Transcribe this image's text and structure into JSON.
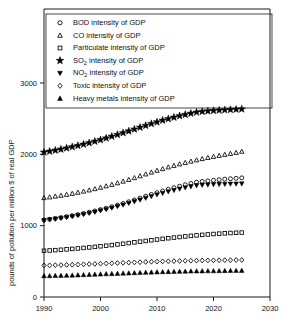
{
  "chart_data": {
    "type": "scatter",
    "title": "",
    "xlabel": "",
    "ylabel": "pounds of pollution per million $ of real GDP",
    "xlim": [
      1990,
      2030
    ],
    "ylim": [
      0,
      3300
    ],
    "xticks": [
      1990,
      2000,
      2010,
      2020,
      2030
    ],
    "yticks": [
      0,
      1000,
      2000,
      3000
    ],
    "grid": false,
    "legend_position": "upper-left",
    "x": [
      1990,
      1991,
      1992,
      1993,
      1994,
      1995,
      1996,
      1997,
      1998,
      1999,
      2000,
      2001,
      2002,
      2003,
      2004,
      2005,
      2006,
      2007,
      2008,
      2009,
      2010,
      2011,
      2012,
      2013,
      2014,
      2015,
      2016,
      2017,
      2018,
      2019,
      2020,
      2021,
      2022,
      2023,
      2024,
      2025
    ],
    "series": [
      {
        "name": "BOD intensity of GDP",
        "marker": "circle",
        "values": [
          1080,
          1090,
          1101,
          1113,
          1126,
          1140,
          1155,
          1171,
          1188,
          1206,
          1225,
          1245,
          1266,
          1288,
          1311,
          1335,
          1360,
          1386,
          1412,
          1438,
          1463,
          1487,
          1510,
          1532,
          1553,
          1573,
          1592,
          1610,
          1620,
          1628,
          1636,
          1644,
          1652,
          1658,
          1664,
          1670
        ]
      },
      {
        "name": "CO intensity of GDP",
        "marker": "triangle-up",
        "values": [
          1390,
          1400,
          1411,
          1423,
          1436,
          1450,
          1465,
          1481,
          1498,
          1516,
          1535,
          1555,
          1576,
          1598,
          1621,
          1645,
          1670,
          1696,
          1722,
          1748,
          1773,
          1797,
          1820,
          1842,
          1863,
          1883,
          1902,
          1920,
          1937,
          1953,
          1968,
          1982,
          1996,
          2010,
          2024,
          2040
        ]
      },
      {
        "name": "Particulate intensity of GDP",
        "marker": "square",
        "values": [
          648,
          652,
          657,
          662,
          668,
          674,
          681,
          688,
          695,
          703,
          711,
          719,
          728,
          737,
          746,
          756,
          766,
          776,
          786,
          796,
          806,
          815,
          824,
          833,
          841,
          849,
          857,
          864,
          871,
          877,
          883,
          888,
          893,
          897,
          900,
          903
        ]
      },
      {
        "name": "SO2 intensity of GDP",
        "marker": "star",
        "values": [
          2030,
          2042,
          2056,
          2071,
          2087,
          2104,
          2122,
          2141,
          2161,
          2182,
          2204,
          2227,
          2251,
          2276,
          2301,
          2326,
          2352,
          2378,
          2404,
          2429,
          2453,
          2476,
          2498,
          2519,
          2539,
          2557,
          2574,
          2590,
          2600,
          2607,
          2613,
          2618,
          2622,
          2626,
          2630,
          2634
        ]
      },
      {
        "name": "NO2 intensity of GDP",
        "marker": "triangle-down",
        "values": [
          1075,
          1084,
          1094,
          1105,
          1117,
          1130,
          1144,
          1159,
          1175,
          1192,
          1210,
          1229,
          1249,
          1270,
          1292,
          1315,
          1339,
          1363,
          1387,
          1411,
          1434,
          1456,
          1477,
          1497,
          1516,
          1533,
          1549,
          1563,
          1570,
          1574,
          1578,
          1581,
          1583,
          1585,
          1586,
          1588
        ]
      },
      {
        "name": "Toxic intensity of GDP",
        "marker": "diamond",
        "values": [
          443,
          444,
          446,
          448,
          450,
          452,
          455,
          458,
          461,
          464,
          467,
          470,
          473,
          476,
          479,
          482,
          485,
          488,
          491,
          494,
          497,
          499,
          501,
          503,
          505,
          507,
          509,
          511,
          512,
          513,
          514,
          515,
          516,
          517,
          518,
          519
        ]
      },
      {
        "name": "Heavy metals intensity of GDP",
        "marker": "triangle-up-filled",
        "values": [
          296,
          297,
          299,
          301,
          303,
          305,
          308,
          311,
          314,
          317,
          320,
          323,
          326,
          329,
          332,
          335,
          338,
          341,
          344,
          347,
          350,
          352,
          354,
          356,
          358,
          360,
          362,
          363,
          364,
          365,
          366,
          367,
          368,
          369,
          370,
          371
        ]
      }
    ]
  },
  "legend": {
    "entries": [
      {
        "marker": "circle",
        "label": "BOD intensity of GDP",
        "base": "BOD",
        "sub": "",
        "rest": " intensity of GDP"
      },
      {
        "marker": "triangle-up",
        "label": "CO intensity of GDP",
        "base": "CO",
        "sub": "",
        "rest": " intensity of GDP"
      },
      {
        "marker": "square",
        "label": "Particulate intensity of GDP",
        "base": "Particulate",
        "sub": "",
        "rest": " intensity of GDP"
      },
      {
        "marker": "star",
        "label": "SO2 intensity of GDP",
        "base": "SO",
        "sub": "2",
        "rest": " intensity of GDP"
      },
      {
        "marker": "triangle-down",
        "label": "NO2 intensity of GDP",
        "base": "NO",
        "sub": "2",
        "rest": " intensity of GDP"
      },
      {
        "marker": "diamond",
        "label": "Toxic intensity of GDP",
        "base": "Toxic",
        "sub": "",
        "rest": " intensity of GDP"
      },
      {
        "marker": "triangle-up-filled",
        "label": "Heavy metals intensity of GDP",
        "base": "Heavy metals",
        "sub": "",
        "rest": " intensity of GDP"
      }
    ]
  },
  "axes": {
    "y_title": "pounds of pollution per million $ of real GDP",
    "y_tick_labels": [
      "0",
      "1000",
      "2000",
      "3000"
    ],
    "x_tick_labels": [
      "1990",
      "2000",
      "2010",
      "2020",
      "2030"
    ]
  },
  "colors": {
    "ink": "#000000",
    "frame": "#1a1a1a",
    "background": "#ffffff"
  }
}
